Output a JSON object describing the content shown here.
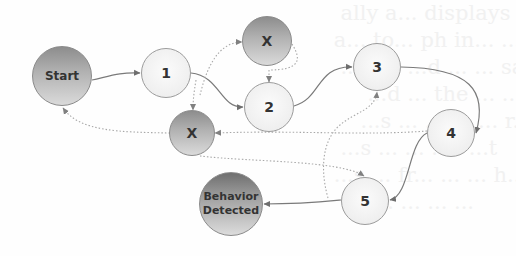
{
  "diagram": {
    "type": "state-transition",
    "nodes": [
      {
        "id": "start",
        "label": "Start",
        "style": "dark"
      },
      {
        "id": "n1",
        "label": "1",
        "style": "light"
      },
      {
        "id": "x_top",
        "label": "X",
        "style": "dark"
      },
      {
        "id": "n2",
        "label": "2",
        "style": "light"
      },
      {
        "id": "n3",
        "label": "3",
        "style": "light"
      },
      {
        "id": "x_bottom",
        "label": "X",
        "style": "dark"
      },
      {
        "id": "n4",
        "label": "4",
        "style": "light"
      },
      {
        "id": "n5",
        "label": "5",
        "style": "light"
      },
      {
        "id": "detected",
        "label_line1": "Behavior",
        "label_line2": "Detected",
        "style": "dark"
      }
    ],
    "edges": [
      {
        "from": "start",
        "to": "n1",
        "style": "solid"
      },
      {
        "from": "n1",
        "to": "n2",
        "style": "solid"
      },
      {
        "from": "n2",
        "to": "n3",
        "style": "solid"
      },
      {
        "from": "n3",
        "to": "n4",
        "style": "solid"
      },
      {
        "from": "n4",
        "to": "n5",
        "style": "solid"
      },
      {
        "from": "n5",
        "to": "detected",
        "style": "solid"
      },
      {
        "from": "n1",
        "to": "x_top",
        "style": "dotted"
      },
      {
        "from": "n1",
        "to": "x_bottom",
        "style": "dotted"
      },
      {
        "from": "x_top",
        "to": "n2",
        "style": "dotted"
      },
      {
        "from": "n4",
        "to": "x_bottom",
        "style": "dotted"
      },
      {
        "from": "x_bottom",
        "to": "start",
        "style": "dotted"
      },
      {
        "from": "x_bottom",
        "to": "n5",
        "style": "dotted"
      },
      {
        "from": "n5",
        "to": "n3",
        "style": "dotted"
      }
    ]
  },
  "colors": {
    "solid_edge": "#7a7a7a",
    "dotted_edge": "#a8a8a8",
    "light_node": "#eeeeee",
    "dark_node": "#a0a0a0"
  }
}
